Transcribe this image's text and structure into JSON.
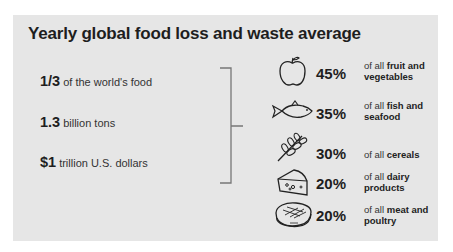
{
  "title": "Yearly global food loss and waste average",
  "totals": [
    {
      "value": "1/3",
      "text": "of the world's food"
    },
    {
      "value": "1.3",
      "text": "billion tons"
    },
    {
      "value": "$1",
      "text": "trillion U.S. dollars"
    }
  ],
  "categories": [
    {
      "icon": "apple-icon",
      "pct": "45%",
      "prefix": "of all",
      "line1": "fruit and",
      "line2": "vegetables"
    },
    {
      "icon": "fish-icon",
      "pct": "35%",
      "prefix": "of all",
      "line1": "fish and",
      "line2": "seafood"
    },
    {
      "icon": "wheat-icon",
      "pct": "30%",
      "prefix": "of all",
      "line1": "cereals",
      "line2": ""
    },
    {
      "icon": "cheese-icon",
      "pct": "20%",
      "prefix": "of all",
      "line1": "dairy",
      "line2": "products"
    },
    {
      "icon": "steak-icon",
      "pct": "20%",
      "prefix": "of all",
      "line1": "meat and",
      "line2": "poultry"
    }
  ],
  "colors": {
    "panel": "#e6e6e6",
    "text": "#1e1e1e",
    "bracket": "#777777"
  }
}
